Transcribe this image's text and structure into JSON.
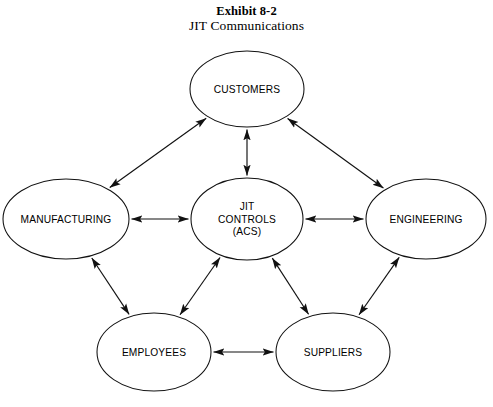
{
  "title": {
    "line1": "Exhibit 8-2",
    "line2": "JIT Communications"
  },
  "diagram": {
    "type": "network-diagram",
    "canvas": {
      "width": 493,
      "height": 407
    },
    "stroke_color": "#111111",
    "fill_color": "#ffffff",
    "text_color": "#000000",
    "nodes": [
      {
        "id": "customers",
        "label": "CUSTOMERS",
        "lines": [
          "CUSTOMERS"
        ],
        "cx": 247,
        "cy": 89,
        "rx": 57,
        "ry": 38
      },
      {
        "id": "manufacturing",
        "label": "MANUFACTURING",
        "lines": [
          "MANUFACTURING"
        ],
        "cx": 66,
        "cy": 219,
        "rx": 63,
        "ry": 40
      },
      {
        "id": "jit-controls",
        "label": "JIT CONTROLS (ACS)",
        "lines": [
          "JIT",
          "CONTROLS",
          "(ACS)"
        ],
        "cx": 247,
        "cy": 219,
        "rx": 56,
        "ry": 41
      },
      {
        "id": "engineering",
        "label": "ENGINEERING",
        "lines": [
          "ENGINEERING"
        ],
        "cx": 426,
        "cy": 219,
        "rx": 60,
        "ry": 40
      },
      {
        "id": "employees",
        "label": "EMPLOYEES",
        "lines": [
          "EMPLOYEES"
        ],
        "cx": 154,
        "cy": 352,
        "rx": 57,
        "ry": 39
      },
      {
        "id": "suppliers",
        "label": "SUPPLIERS",
        "lines": [
          "SUPPLIERS"
        ],
        "cx": 333,
        "cy": 352,
        "rx": 57,
        "ry": 39
      }
    ],
    "edges": [
      {
        "id": "manufacturing-customers",
        "from": "manufacturing",
        "to": "customers",
        "direction": "both"
      },
      {
        "id": "customers-jit-controls",
        "from": "customers",
        "to": "jit-controls",
        "direction": "both"
      },
      {
        "id": "customers-engineering",
        "from": "customers",
        "to": "engineering",
        "direction": "both"
      },
      {
        "id": "manufacturing-jit-controls",
        "from": "manufacturing",
        "to": "jit-controls",
        "direction": "both"
      },
      {
        "id": "jit-controls-engineering",
        "from": "jit-controls",
        "to": "engineering",
        "direction": "both"
      },
      {
        "id": "manufacturing-employees",
        "from": "manufacturing",
        "to": "employees",
        "direction": "both"
      },
      {
        "id": "employees-jit-controls",
        "from": "employees",
        "to": "jit-controls",
        "direction": "both"
      },
      {
        "id": "jit-controls-suppliers",
        "from": "jit-controls",
        "to": "suppliers",
        "direction": "both"
      },
      {
        "id": "suppliers-engineering",
        "from": "suppliers",
        "to": "engineering",
        "direction": "both"
      },
      {
        "id": "employees-suppliers",
        "from": "employees",
        "to": "suppliers",
        "direction": "both"
      }
    ]
  }
}
